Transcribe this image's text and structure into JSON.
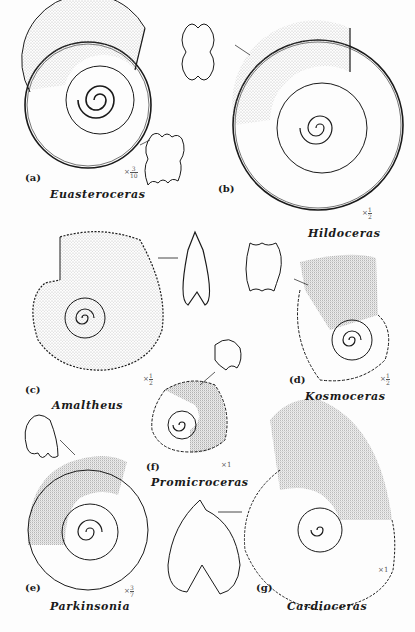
{
  "figure": {
    "panels": [
      {
        "id": "a",
        "label": "(a)",
        "genus": "Euasteroceras",
        "scale": {
          "prefix": "×",
          "numerator": "3",
          "denominator": "10"
        }
      },
      {
        "id": "b",
        "label": "(b)",
        "genus": "Hildoceras",
        "scale": {
          "prefix": "×",
          "numerator": "1",
          "denominator": "2"
        }
      },
      {
        "id": "c",
        "label": "(c)",
        "genus": "Amaltheus",
        "scale": {
          "prefix": "×",
          "numerator": "1",
          "denominator": "2"
        }
      },
      {
        "id": "d",
        "label": "(d)",
        "genus": "Kosmoceras",
        "scale": {
          "prefix": "×",
          "numerator": "1",
          "denominator": "2"
        }
      },
      {
        "id": "e",
        "label": "(e)",
        "genus": "Parkinsonia",
        "scale": {
          "prefix": "×",
          "numerator": "3",
          "denominator": "7"
        }
      },
      {
        "id": "f",
        "label": "(f)",
        "genus": "Promicroceras",
        "scale": {
          "prefix": "×",
          "value": "1"
        }
      },
      {
        "id": "g",
        "label": "(g)",
        "genus": "Cardioceras",
        "scale": {
          "prefix": "×",
          "value": "1"
        }
      }
    ]
  },
  "colors": {
    "ink": "#1a1a1a",
    "stipple": "#8a8a8a",
    "paper": "#fdfdfd"
  }
}
